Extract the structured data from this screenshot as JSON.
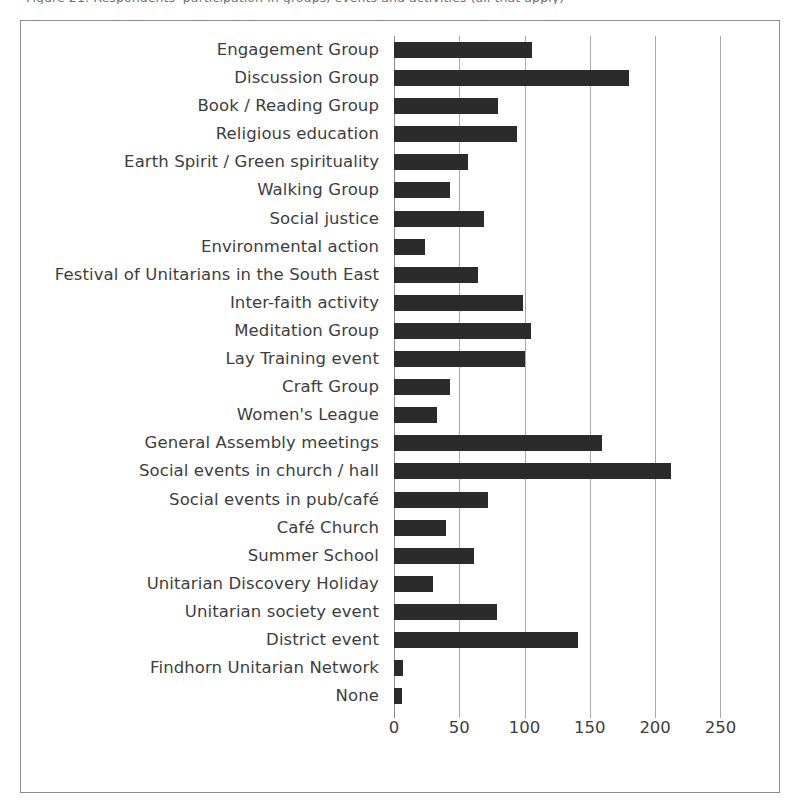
{
  "caption_sliver": "Figure 21: Respondents' participation in groups, events and activities (all that apply)",
  "chart_data": {
    "type": "bar",
    "orientation": "horizontal",
    "title": "",
    "xlabel": "",
    "ylabel": "",
    "xlim": [
      0,
      265
    ],
    "xticks": [
      0,
      50,
      100,
      150,
      200,
      250
    ],
    "grid": true,
    "legend": "none",
    "bar_color": "#2b2b2b",
    "categories": [
      "Engagement Group",
      "Discussion Group",
      "Book / Reading Group",
      "Religious education",
      "Earth Spirit / Green spirituality",
      "Walking Group",
      "Social justice",
      "Environmental action",
      "Festival of Unitarians in the South East",
      "Inter-faith activity",
      "Meditation Group",
      "Lay Training event",
      "Craft Group",
      "Women's League",
      "General Assembly meetings",
      "Social events in church / hall",
      "Social events in pub/café",
      "Café Church",
      "Summer School",
      "Unitarian Discovery Holiday",
      "Unitarian society event",
      "District event",
      "Findhorn Unitarian Network",
      "None"
    ],
    "values": [
      106,
      180,
      80,
      94,
      57,
      43,
      69,
      24,
      64,
      99,
      105,
      100,
      43,
      33,
      159,
      212,
      72,
      40,
      61,
      30,
      79,
      141,
      7,
      6
    ]
  }
}
